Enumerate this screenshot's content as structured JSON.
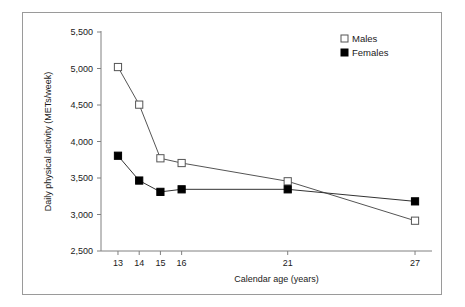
{
  "figure": {
    "border_color": "#9a9a9a",
    "background": "#ffffff"
  },
  "chart_data": {
    "type": "line",
    "title": "",
    "subtitle": "",
    "xlabel": "Calendar age (years)",
    "ylabel": "Daily physical activity (METs/week)",
    "x": [
      13,
      14,
      15,
      16,
      21,
      27
    ],
    "xtick_labels": [
      "13",
      "14",
      "15",
      "16",
      "21",
      "27"
    ],
    "xlim": [
      12.2,
      27.8
    ],
    "ylim": [
      2500,
      5500
    ],
    "ytick_values": [
      2500,
      3000,
      3500,
      4000,
      4500,
      5000,
      5500
    ],
    "ytick_labels": [
      "2,500",
      "3,000",
      "3,500",
      "4,000",
      "4,500",
      "5,000",
      "5,500"
    ],
    "grid": false,
    "legend_position": "top-right",
    "series": [
      {
        "name": "Males",
        "marker": "open-square",
        "marker_fill": "#ffffff",
        "marker_edge": "#555555",
        "line_color": "#555555",
        "values": [
          5020,
          4505,
          3770,
          3705,
          3455,
          2915
        ]
      },
      {
        "name": "Females",
        "marker": "filled-square",
        "marker_fill": "#000000",
        "marker_edge": "#000000",
        "line_color": "#333333",
        "values": [
          3805,
          3465,
          3310,
          3345,
          3345,
          3180
        ]
      }
    ]
  },
  "legend": {
    "items": [
      {
        "label": "Males"
      },
      {
        "label": "Females"
      }
    ]
  }
}
